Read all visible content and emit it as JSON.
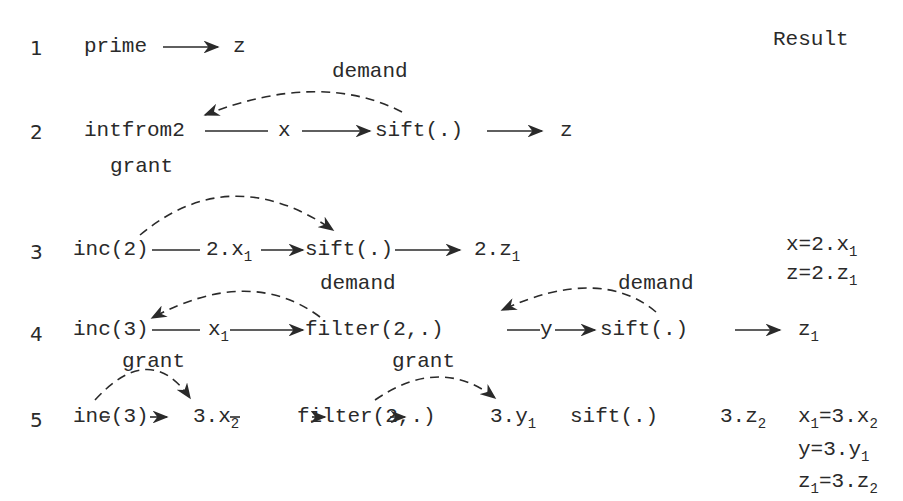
{
  "header": {
    "result_label": "Result"
  },
  "rows": [
    {
      "step": "1",
      "items": [
        "prime",
        "z"
      ]
    },
    {
      "step": "2",
      "items": [
        "intfrom2",
        "x",
        "sift(.)",
        "z"
      ],
      "arcs": [
        "demand"
      ]
    },
    {
      "step": "3",
      "items": [
        "inc(2)",
        "2.x",
        "sift(.)",
        "2.z"
      ],
      "subs": [
        "1",
        "1"
      ],
      "arcs": [
        "grant"
      ],
      "results": [
        {
          "text": "x=2.x",
          "sub": "1"
        },
        {
          "text": "z=2.z",
          "sub": "1"
        }
      ]
    },
    {
      "step": "4",
      "items": [
        "inc(3)",
        "x",
        "filter(2,.)",
        "y",
        "sift(.)",
        "z"
      ],
      "subs": [
        "1",
        "1"
      ],
      "arcs": [
        "demand",
        "demand"
      ]
    },
    {
      "step": "5",
      "items": [
        "inc(3)",
        "3.x",
        "filter(2,.)",
        "3.y",
        "sift(.)",
        "3.z"
      ],
      "subs": [
        "2",
        "1",
        "2"
      ],
      "arcs": [
        "grant",
        "grant"
      ],
      "results": [
        {
          "pre": "x",
          "pre_sub": "1",
          "text": "=3.x",
          "sub": "2"
        },
        {
          "text": "y=3.y",
          "sub": "1"
        },
        {
          "pre": "z",
          "pre_sub": "1",
          "text": "=3.z",
          "sub": "2"
        }
      ]
    }
  ]
}
